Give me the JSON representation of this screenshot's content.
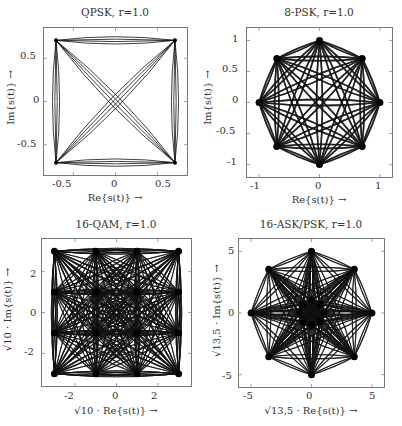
{
  "chart_data": [
    {
      "type": "scatter",
      "title": "QPSK, r=1.0",
      "xlabel": "Re{s(t)} →",
      "ylabel": "Im{s(t)} →",
      "xlim": [
        -0.85,
        0.85
      ],
      "ylim": [
        -0.85,
        0.85
      ],
      "xticks": [
        "-0.5",
        "0",
        "0.5"
      ],
      "xtick_values": [
        -0.5,
        0,
        0.5
      ],
      "yticks": [
        "-0.5",
        "0",
        "0.5"
      ],
      "ytick_values": [
        -0.5,
        0,
        0.5
      ],
      "constellation": [
        [
          0.707,
          0.707
        ],
        [
          -0.707,
          0.707
        ],
        [
          -0.707,
          -0.707
        ],
        [
          0.707,
          -0.707
        ]
      ],
      "description": "Signal trajectories between 4 QPSK symbols; diagonals cross origin"
    },
    {
      "type": "scatter",
      "title": "8-PSK, r=1.0",
      "xlabel": "Re{s(t)} →",
      "ylabel": "Im{s(t)} →",
      "xlim": [
        -1.2,
        1.2
      ],
      "ylim": [
        -1.2,
        1.2
      ],
      "xticks": [
        "-1",
        "0",
        "1"
      ],
      "xtick_values": [
        -1,
        0,
        1
      ],
      "yticks": [
        "-1",
        "-0.5",
        "0",
        "0.5",
        "1"
      ],
      "ytick_values": [
        -1,
        -0.5,
        0,
        0.5,
        1
      ],
      "constellation": [
        [
          1,
          0
        ],
        [
          0.707,
          0.707
        ],
        [
          0,
          1
        ],
        [
          -0.707,
          0.707
        ],
        [
          -1,
          0
        ],
        [
          -0.707,
          -0.707
        ],
        [
          0,
          -1
        ],
        [
          0.707,
          -0.707
        ]
      ],
      "description": "Signal trajectories between all 8 PSK symbols on unit circle"
    },
    {
      "type": "scatter",
      "title": "16-QAM, r=1.0",
      "xlabel": "√10 · Re{s(t)} →",
      "ylabel": "√10 · Im{s(t)} →",
      "xlim": [
        -3.6,
        3.6
      ],
      "ylim": [
        -3.6,
        3.6
      ],
      "xticks": [
        "-2",
        "0",
        "2"
      ],
      "xtick_values": [
        -2,
        0,
        2
      ],
      "yticks": [
        "-2",
        "0",
        "2"
      ],
      "ytick_values": [
        -2,
        0,
        2
      ],
      "constellation": [
        [
          -3,
          -3
        ],
        [
          -3,
          -1
        ],
        [
          -3,
          1
        ],
        [
          -3,
          3
        ],
        [
          -1,
          -3
        ],
        [
          -1,
          -1
        ],
        [
          -1,
          1
        ],
        [
          -1,
          3
        ],
        [
          1,
          -3
        ],
        [
          1,
          -1
        ],
        [
          1,
          1
        ],
        [
          1,
          3
        ],
        [
          3,
          -3
        ],
        [
          3,
          -1
        ],
        [
          3,
          1
        ],
        [
          3,
          3
        ]
      ],
      "description": "Signal trajectories between all 16 QAM symbols on 4x4 grid"
    },
    {
      "type": "scatter",
      "title": "16-ASK/PSK, r=1.0",
      "xlabel": "√13,5 · Re{s(t)} →",
      "ylabel": "√13,5 · Im{s(t)} →",
      "xlim": [
        -6,
        6
      ],
      "ylim": [
        -6,
        6
      ],
      "xticks": [
        "-5",
        "0",
        "5"
      ],
      "xtick_values": [
        -5,
        0,
        5
      ],
      "yticks": [
        "-5",
        "0",
        "5"
      ],
      "ytick_values": [
        -5,
        0,
        5
      ],
      "constellation": [
        [
          1,
          0
        ],
        [
          0.707,
          0.707
        ],
        [
          0,
          1
        ],
        [
          -0.707,
          0.707
        ],
        [
          -1,
          0
        ],
        [
          -0.707,
          -0.707
        ],
        [
          0,
          -1
        ],
        [
          0.707,
          -0.707
        ],
        [
          5,
          0
        ],
        [
          3.54,
          3.54
        ],
        [
          0,
          5
        ],
        [
          -3.54,
          3.54
        ],
        [
          -5,
          0
        ],
        [
          -3.54,
          -3.54
        ],
        [
          0,
          -5
        ],
        [
          3.54,
          -3.54
        ]
      ],
      "description": "Two-ring 8+8 ASK/PSK constellation with radii ~1 and ~5; dense trajectories"
    }
  ]
}
